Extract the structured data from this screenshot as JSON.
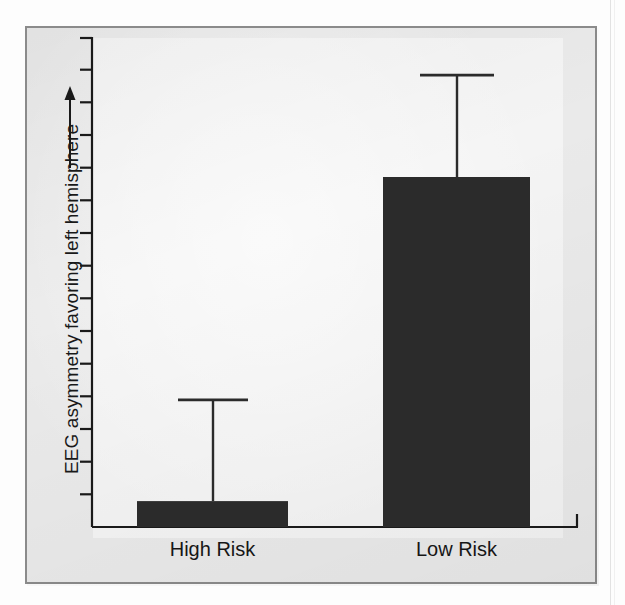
{
  "figure": {
    "kind": "bar-chart-figure",
    "background_color": "#eaeaea",
    "plot_background_color": "#f4f4f4",
    "frame_color": "#8b8b8b",
    "bar_color": "#2b2b2b",
    "axis_color": "#1a1a1a"
  },
  "axis": {
    "y_label": "EEG asymmetry favoring left hemisphere",
    "y_label_arrow": "up-arrow",
    "y_tick_count": 15,
    "y_ticks_labeled": false,
    "x_label": ""
  },
  "chart_data": {
    "type": "bar",
    "title": "",
    "subtitle": "",
    "xlabel": "",
    "ylabel": "EEG asymmetry favoring left hemisphere",
    "categories": [
      "High Risk",
      "Low Risk"
    ],
    "values": [
      0.074,
      1.0
    ],
    "errors_upper": [
      0.289,
      0.291
    ],
    "error_bar_tops": [
      0.363,
      1.291
    ],
    "ylim": [
      0,
      1.4
    ],
    "grid": false,
    "legend": "none",
    "annotations": [
      "Upward arrow beside y-axis caption indicates increasing left-hemisphere asymmetry"
    ]
  },
  "labels": {
    "categories": [
      "High Risk",
      "Low Risk"
    ]
  }
}
